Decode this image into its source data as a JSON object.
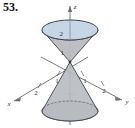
{
  "exercise": {
    "number": "53."
  },
  "figure": {
    "colors": {
      "top_disc_fill": "#c3d4e6",
      "top_disc_stroke": "#3d4450",
      "cone_fill": "#b9bcc0",
      "cone_stroke": "#3d4450",
      "bottom_disc_fill": "#aeb7c2",
      "axis_stroke": "#6b6b6b",
      "hidden_edge_stroke": "#5a5f66",
      "background": "#ffffff"
    },
    "axes": [
      {
        "name": "x",
        "label": "x",
        "direction": "lower-left",
        "ticks": [
          {
            "value": "1",
            "label": "1"
          },
          {
            "value": "2",
            "label": "2"
          }
        ]
      },
      {
        "name": "y",
        "label": "y",
        "direction": "lower-right",
        "ticks": [
          {
            "value": "1",
            "label": "1"
          },
          {
            "value": "2",
            "label": "2"
          }
        ]
      },
      {
        "name": "z",
        "label": "z",
        "direction": "vertical-up",
        "ticks": [
          {
            "value": "1",
            "label": "1"
          },
          {
            "value": "2",
            "label": "2"
          }
        ]
      }
    ],
    "surface": {
      "shape": "double cone",
      "vertex": "origin",
      "upper_nappe_top_radius": "2",
      "upper_nappe_height": "2",
      "lower_nappe_depth": "2"
    }
  }
}
